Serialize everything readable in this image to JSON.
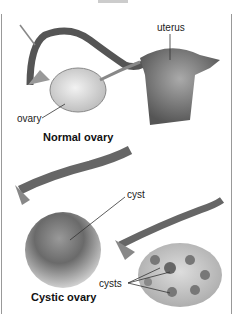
{
  "figure": {
    "panels": [
      {
        "caption": "Normal ovary",
        "labels": [
          "uterus",
          "ovary"
        ]
      },
      {
        "caption": "Cystic ovary",
        "labels": [
          "cyst",
          "cysts"
        ]
      }
    ]
  }
}
